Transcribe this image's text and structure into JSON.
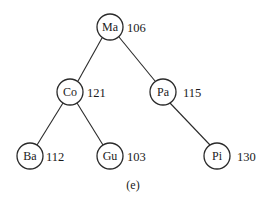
{
  "diagram": {
    "type": "binary-tree",
    "caption": "(e)",
    "nodes": [
      {
        "id": "Ma",
        "label": "Ma",
        "value": "106",
        "x": 110,
        "y": 27
      },
      {
        "id": "Co",
        "label": "Co",
        "value": "121",
        "x": 70,
        "y": 92
      },
      {
        "id": "Pa",
        "label": "Pa",
        "value": "115",
        "x": 163,
        "y": 92
      },
      {
        "id": "Ba",
        "label": "Ba",
        "value": "112",
        "x": 30,
        "y": 156
      },
      {
        "id": "Gu",
        "label": "Gu",
        "value": "103",
        "x": 110,
        "y": 156
      },
      {
        "id": "Pi",
        "label": "Pi",
        "value": "130",
        "x": 217,
        "y": 156
      }
    ],
    "edges": [
      {
        "from": "Ma",
        "to": "Co"
      },
      {
        "from": "Ma",
        "to": "Pa"
      },
      {
        "from": "Co",
        "to": "Ba"
      },
      {
        "from": "Co",
        "to": "Gu"
      },
      {
        "from": "Pa",
        "to": "Pi"
      }
    ]
  }
}
